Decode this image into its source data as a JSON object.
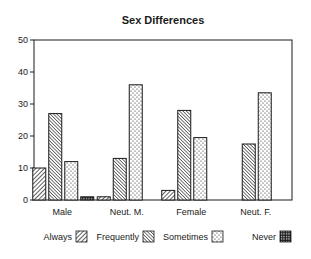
{
  "chart_data": {
    "type": "bar",
    "title": "Sex Differences",
    "xlabel": "",
    "ylabel": "",
    "ylim": [
      0,
      50
    ],
    "yticks": [
      0,
      10,
      20,
      30,
      40,
      50
    ],
    "grid": false,
    "legend_position": "bottom",
    "categories": [
      "Male",
      "Neut. M.",
      "Female",
      "Neut. F."
    ],
    "series": [
      {
        "name": "Always",
        "pattern": "diagonal-hatch",
        "values": [
          10,
          1,
          3,
          0
        ]
      },
      {
        "name": "Frequently",
        "pattern": "dense-diagonal-hatch",
        "values": [
          27,
          13,
          28,
          17.5
        ]
      },
      {
        "name": "Sometimes",
        "pattern": "dots",
        "values": [
          12,
          36,
          19.5,
          33.5
        ]
      },
      {
        "name": "Never",
        "pattern": "grid",
        "values": [
          1,
          0,
          0,
          0
        ]
      }
    ]
  },
  "colors": {
    "ink": "#1a1a1a",
    "background": "#ffffff"
  }
}
